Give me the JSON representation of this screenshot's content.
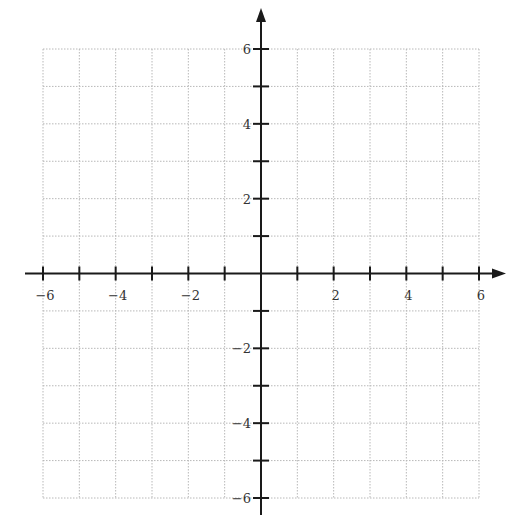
{
  "chart_data": {
    "type": "scatter",
    "title": "",
    "xlabel": "",
    "ylabel": "",
    "xlim": [
      -6,
      6
    ],
    "ylim": [
      -6,
      6
    ],
    "grid": true,
    "grid_style": "dotted",
    "axes_arrows": true,
    "x_ticks": [
      -6,
      -5,
      -4,
      -3,
      -2,
      -1,
      1,
      2,
      3,
      4,
      5,
      6
    ],
    "y_ticks": [
      -6,
      -5,
      -4,
      -3,
      -2,
      -1,
      1,
      2,
      3,
      4,
      5,
      6
    ],
    "x_tick_labels": [
      {
        "value": -6,
        "label": "−6"
      },
      {
        "value": -4,
        "label": "−4"
      },
      {
        "value": -2,
        "label": "−2"
      },
      {
        "value": 2,
        "label": "2"
      },
      {
        "value": 4,
        "label": "4"
      },
      {
        "value": 6,
        "label": "6"
      }
    ],
    "y_tick_labels": [
      {
        "value": 6,
        "label": "6"
      },
      {
        "value": 4,
        "label": "4"
      },
      {
        "value": 2,
        "label": "2"
      },
      {
        "value": -2,
        "label": "−2"
      },
      {
        "value": -4,
        "label": "−4"
      },
      {
        "value": -6,
        "label": "−6"
      }
    ],
    "series": []
  },
  "colors": {
    "axis": "#1a1a1a",
    "grid": "#b8b8b8",
    "label": "#333333"
  },
  "layout": {
    "x_left_px": 43,
    "x_right_px": 479,
    "y_top_px": 49,
    "y_bottom_px": 498,
    "origin_x_px": 261,
    "origin_y_px": 272,
    "axis_x_start": 25,
    "axis_x_end": 506,
    "axis_y_start": 8,
    "axis_y_end": 515
  }
}
